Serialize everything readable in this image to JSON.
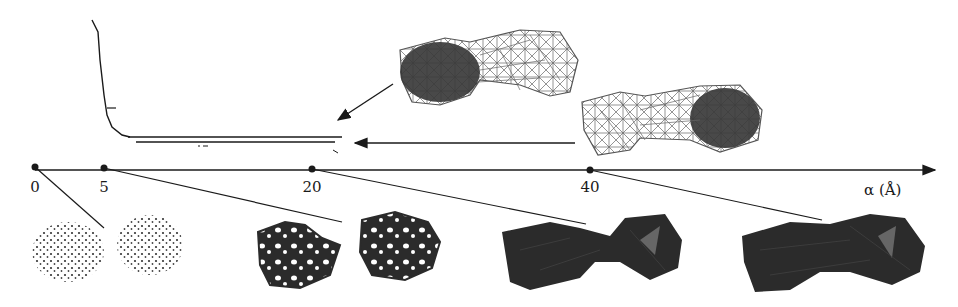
{
  "figure": {
    "axis": {
      "label": "α (Å)",
      "ticks": [
        {
          "value": "0",
          "x": 35
        },
        {
          "value": "5",
          "x": 104
        },
        {
          "value": "20",
          "x": 312
        },
        {
          "value": "40",
          "x": 590
        }
      ]
    },
    "persistence_plot": {
      "description": "Curve dropping steeply then two long horizontal bars (persistent features)"
    },
    "top_shapes": [
      {
        "name": "wireframe-dumbbell-left-cavity",
        "description": "Wireframe dumbbell with shaded left lobe"
      },
      {
        "name": "wireframe-dumbbell-right-cavity",
        "description": "Wireframe dumbbell with shaded right lobe"
      }
    ],
    "bottom_shapes": [
      {
        "name": "point-cloud-pair",
        "alpha": "0"
      },
      {
        "name": "sparse-complex-pair",
        "alpha": "5"
      },
      {
        "name": "dumbbell-complex",
        "alpha": "20"
      },
      {
        "name": "filled-dumbbell",
        "alpha": "40"
      }
    ],
    "colors": {
      "ink": "#1a1a1a",
      "mesh": "#555555",
      "shade": "#3a3a3a",
      "dark_fill": "#2b2b2b"
    }
  }
}
